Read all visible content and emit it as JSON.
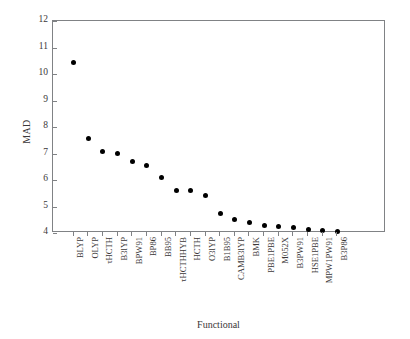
{
  "chart_data": {
    "type": "scatter",
    "title": "",
    "xlabel": "Functional",
    "ylabel": "MAD",
    "ylim": [
      4,
      12
    ],
    "yticks": [
      4,
      5,
      6,
      7,
      8,
      9,
      10,
      11,
      12
    ],
    "ytick_labels": [
      "4",
      "5",
      "6",
      "7",
      "8",
      "9",
      "10",
      "11",
      "12"
    ],
    "grid": false,
    "legend": null,
    "marker": "filled-circle",
    "marker_color": "#000000",
    "categories": [
      "BLYP",
      "OLYP",
      "τHCTH",
      "B3lYP",
      "BPW91",
      "BP86",
      "BB95",
      "τHCTHHYB",
      "HCTH",
      "O3lYP",
      "B1B95",
      "CAMB3lYP",
      "BMK",
      "PBE1PBE",
      "M052X",
      "B3PW91",
      "HSE1PBE",
      "MPW1PW91",
      "B3P86"
    ],
    "values": [
      10.45,
      7.55,
      7.08,
      7.0,
      6.68,
      6.55,
      6.1,
      5.6,
      5.6,
      5.4,
      4.75,
      4.52,
      4.38,
      4.3,
      4.25,
      4.2,
      4.15,
      4.08,
      4.05
    ]
  }
}
